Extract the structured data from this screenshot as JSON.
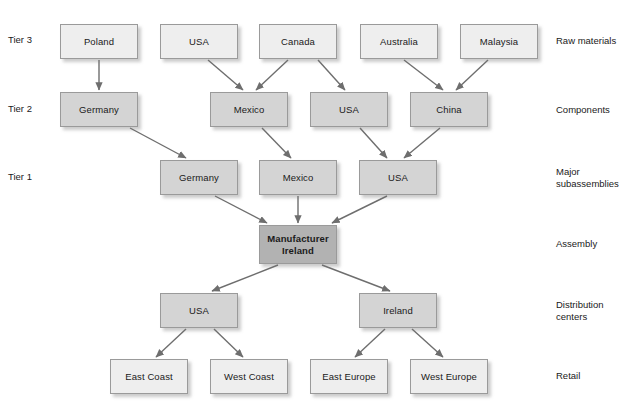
{
  "diagram": {
    "colors": {
      "node_light": "#eeeeee",
      "node_mid": "#d4d4d4",
      "node_dark": "#b2b2b2",
      "border": "#9a9a9a",
      "arrow": "#6e6e6e",
      "text": "#1a1a1a",
      "background": "#ffffff"
    },
    "tier_labels": [
      {
        "id": "tier3",
        "text": "Tier 3",
        "x": 8,
        "y": 34
      },
      {
        "id": "tier2",
        "text": "Tier 2",
        "x": 8,
        "y": 103
      },
      {
        "id": "tier1",
        "text": "Tier 1",
        "x": 8,
        "y": 171
      }
    ],
    "stage_labels": [
      {
        "id": "raw-materials",
        "text": "Raw materials",
        "x": 556,
        "y": 35
      },
      {
        "id": "components",
        "text": "Components",
        "x": 556,
        "y": 104
      },
      {
        "id": "major-subassemblies",
        "text": "Major\nsubassemblies",
        "x": 556,
        "y": 166
      },
      {
        "id": "assembly",
        "text": "Assembly",
        "x": 556,
        "y": 238
      },
      {
        "id": "distribution-centers",
        "text": "Distribution\ncenters",
        "x": 556,
        "y": 299
      },
      {
        "id": "retail",
        "text": "Retail",
        "x": 556,
        "y": 370
      }
    ],
    "nodes": [
      {
        "id": "t3-poland",
        "label": "Poland",
        "x": 60,
        "y": 24,
        "w": 78,
        "h": 35,
        "shade": "lightgray",
        "row": "raw-materials"
      },
      {
        "id": "t3-usa",
        "label": "USA",
        "x": 160,
        "y": 24,
        "w": 78,
        "h": 35,
        "shade": "lightgray",
        "row": "raw-materials"
      },
      {
        "id": "t3-canada",
        "label": "Canada",
        "x": 259,
        "y": 24,
        "w": 78,
        "h": 35,
        "shade": "lightgray",
        "row": "raw-materials"
      },
      {
        "id": "t3-australia",
        "label": "Australia",
        "x": 360,
        "y": 24,
        "w": 78,
        "h": 35,
        "shade": "lightgray",
        "row": "raw-materials"
      },
      {
        "id": "t3-malaysia",
        "label": "Malaysia",
        "x": 460,
        "y": 24,
        "w": 78,
        "h": 35,
        "shade": "lightgray",
        "row": "raw-materials"
      },
      {
        "id": "t2-germany",
        "label": "Germany",
        "x": 60,
        "y": 92,
        "w": 78,
        "h": 35,
        "shade": "midgray",
        "row": "components"
      },
      {
        "id": "t2-mexico",
        "label": "Mexico",
        "x": 210,
        "y": 92,
        "w": 78,
        "h": 35,
        "shade": "midgray",
        "row": "components"
      },
      {
        "id": "t2-usa",
        "label": "USA",
        "x": 310,
        "y": 92,
        "w": 78,
        "h": 35,
        "shade": "midgray",
        "row": "components"
      },
      {
        "id": "t2-china",
        "label": "China",
        "x": 410,
        "y": 92,
        "w": 78,
        "h": 35,
        "shade": "midgray",
        "row": "components"
      },
      {
        "id": "t1-germany",
        "label": "Germany",
        "x": 160,
        "y": 160,
        "w": 78,
        "h": 35,
        "shade": "midgray",
        "row": "major-subassemblies"
      },
      {
        "id": "t1-mexico",
        "label": "Mexico",
        "x": 259,
        "y": 160,
        "w": 78,
        "h": 35,
        "shade": "midgray",
        "row": "major-subassemblies"
      },
      {
        "id": "t1-usa",
        "label": "USA",
        "x": 359,
        "y": 160,
        "w": 78,
        "h": 35,
        "shade": "midgray",
        "row": "major-subassemblies"
      },
      {
        "id": "manufacturer",
        "label": "Manufacturer\nIreland",
        "x": 259,
        "y": 225,
        "w": 78,
        "h": 39,
        "shade": "darkgray",
        "row": "assembly"
      },
      {
        "id": "dc-usa",
        "label": "USA",
        "x": 160,
        "y": 293,
        "w": 78,
        "h": 35,
        "shade": "midgray",
        "row": "distribution-centers"
      },
      {
        "id": "dc-ireland",
        "label": "Ireland",
        "x": 359,
        "y": 293,
        "w": 78,
        "h": 35,
        "shade": "midgray",
        "row": "distribution-centers"
      },
      {
        "id": "r-east-coast",
        "label": "East Coast",
        "x": 110,
        "y": 359,
        "w": 78,
        "h": 35,
        "shade": "lightgray",
        "row": "retail"
      },
      {
        "id": "r-west-coast",
        "label": "West Coast",
        "x": 210,
        "y": 359,
        "w": 78,
        "h": 35,
        "shade": "lightgray",
        "row": "retail"
      },
      {
        "id": "r-east-europe",
        "label": "East Europe",
        "x": 310,
        "y": 359,
        "w": 78,
        "h": 35,
        "shade": "lightgray",
        "row": "retail"
      },
      {
        "id": "r-west-europe",
        "label": "West Europe",
        "x": 410,
        "y": 359,
        "w": 78,
        "h": 35,
        "shade": "lightgray",
        "row": "retail"
      }
    ],
    "edges": [
      {
        "from": "t3-poland",
        "to": "t2-germany",
        "x1": 99,
        "y1": 60,
        "x2": 99,
        "y2": 90
      },
      {
        "from": "t3-usa",
        "to": "t2-mexico",
        "x1": 208,
        "y1": 60,
        "x2": 243,
        "y2": 90
      },
      {
        "from": "t3-canada",
        "to": "t2-mexico",
        "x1": 288,
        "y1": 60,
        "x2": 256,
        "y2": 90
      },
      {
        "from": "t3-canada",
        "to": "t2-usa",
        "x1": 318,
        "y1": 60,
        "x2": 345,
        "y2": 90
      },
      {
        "from": "t3-australia",
        "to": "t2-china",
        "x1": 404,
        "y1": 60,
        "x2": 443,
        "y2": 90
      },
      {
        "from": "t3-malaysia",
        "to": "t2-china",
        "x1": 488,
        "y1": 60,
        "x2": 456,
        "y2": 90
      },
      {
        "from": "t2-germany",
        "to": "t1-germany",
        "x1": 130,
        "y1": 128,
        "x2": 186,
        "y2": 158
      },
      {
        "from": "t2-mexico",
        "to": "t1-mexico",
        "x1": 262,
        "y1": 128,
        "x2": 291,
        "y2": 158
      },
      {
        "from": "t2-usa",
        "to": "t1-usa",
        "x1": 360,
        "y1": 128,
        "x2": 387,
        "y2": 158
      },
      {
        "from": "t2-china",
        "to": "t1-usa",
        "x1": 440,
        "y1": 128,
        "x2": 404,
        "y2": 158
      },
      {
        "from": "t1-germany",
        "to": "manufacturer",
        "x1": 215,
        "y1": 196,
        "x2": 267,
        "y2": 223
      },
      {
        "from": "t1-mexico",
        "to": "manufacturer",
        "x1": 298,
        "y1": 196,
        "x2": 298,
        "y2": 223
      },
      {
        "from": "t1-usa",
        "to": "manufacturer",
        "x1": 387,
        "y1": 196,
        "x2": 332,
        "y2": 223
      },
      {
        "from": "manufacturer",
        "to": "dc-usa",
        "x1": 278,
        "y1": 265,
        "x2": 212,
        "y2": 291
      },
      {
        "from": "manufacturer",
        "to": "dc-ireland",
        "x1": 322,
        "y1": 265,
        "x2": 390,
        "y2": 291
      },
      {
        "from": "dc-usa",
        "to": "r-east-coast",
        "x1": 186,
        "y1": 329,
        "x2": 156,
        "y2": 357
      },
      {
        "from": "dc-usa",
        "to": "r-west-coast",
        "x1": 214,
        "y1": 329,
        "x2": 243,
        "y2": 357
      },
      {
        "from": "dc-ireland",
        "to": "r-east-europe",
        "x1": 385,
        "y1": 329,
        "x2": 355,
        "y2": 357
      },
      {
        "from": "dc-ireland",
        "to": "r-west-europe",
        "x1": 412,
        "y1": 329,
        "x2": 443,
        "y2": 357
      }
    ]
  }
}
